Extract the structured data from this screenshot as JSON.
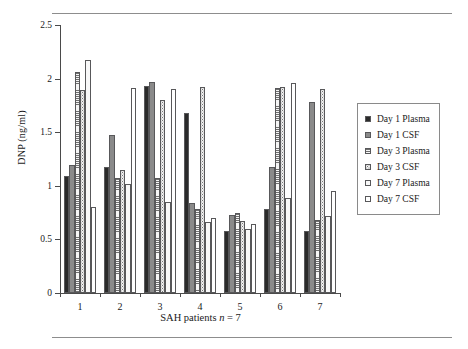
{
  "figure": {
    "ylabel": "DNP (ng/ml)",
    "xlabel_prefix": "SAH patients ",
    "xlabel_italic": "n",
    "xlabel_suffix": " = 7"
  },
  "chart_data": {
    "type": "bar",
    "title": "",
    "subtitle": "",
    "xlabel": "SAH patients n = 7",
    "ylabel": "DNP (ng/ml)",
    "ylim": [
      0,
      2.5
    ],
    "yticks": [
      0,
      0.5,
      1,
      1.5,
      2,
      2.5
    ],
    "ytick_labels": [
      "0",
      "0.5",
      "1",
      "1.5",
      "2",
      "2.5"
    ],
    "grid": false,
    "legend_position": "right",
    "categories": [
      "1",
      "2",
      "3",
      "4",
      "5",
      "6",
      "7"
    ],
    "series": [
      {
        "name": "Day 1 Plasma",
        "pattern": "solid-black",
        "color": "#2b2b2b",
        "values": [
          1.09,
          1.18,
          1.93,
          1.68,
          0.58,
          0.78,
          0.58
        ]
      },
      {
        "name": "Day 1 CSF",
        "pattern": "solid-gray",
        "color": "#8a8a8a",
        "values": [
          1.19,
          1.47,
          1.97,
          0.84,
          0.73,
          1.18,
          1.78
        ]
      },
      {
        "name": "Day 3 Plasma",
        "pattern": "horizontal-lines",
        "color": "#f2f2f2",
        "values": [
          2.06,
          1.07,
          1.07,
          0.78,
          0.75,
          1.91,
          0.68
        ]
      },
      {
        "name": "Day 3 CSF",
        "pattern": "dense-dots",
        "color": "#f0f0f0",
        "values": [
          1.89,
          1.15,
          1.8,
          1.92,
          0.67,
          1.92,
          1.9
        ]
      },
      {
        "name": "Day 7 Plasma",
        "pattern": "sparse-dots",
        "color": "#f8f8f8",
        "values": [
          2.17,
          1.02,
          0.85,
          0.66,
          0.6,
          0.89,
          0.72
        ]
      },
      {
        "name": "Day 7 CSF",
        "pattern": "white",
        "color": "#ffffff",
        "values": [
          0.8,
          1.91,
          1.9,
          0.7,
          0.64,
          1.96,
          0.95
        ]
      }
    ]
  }
}
